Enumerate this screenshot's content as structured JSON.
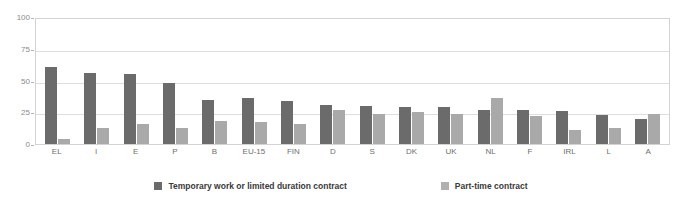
{
  "chart_data": {
    "type": "bar",
    "title": "",
    "xlabel": "",
    "ylabel": "",
    "ylim": [
      0,
      100
    ],
    "yticks": [
      "0",
      "25",
      "50",
      "75",
      "100"
    ],
    "grid": true,
    "legend_position": "bottom",
    "categories": [
      "EL",
      "I",
      "E",
      "P",
      "B",
      "EU-15",
      "FIN",
      "D",
      "S",
      "DK",
      "UK",
      "NL",
      "F",
      "IRL",
      "L",
      "A"
    ],
    "series": [
      {
        "name": "Temporary work or limited duration contract",
        "color": "#6b6b6b",
        "values": [
          61,
          56,
          55,
          48,
          35,
          36,
          34,
          31,
          30,
          29,
          29,
          27,
          27,
          26,
          23,
          20
        ]
      },
      {
        "name": "Part-time contract",
        "color": "#a9a9a9",
        "values": [
          4,
          13,
          16,
          13,
          18,
          17,
          16,
          27,
          24,
          25,
          24,
          36,
          22,
          11,
          13,
          24
        ]
      }
    ]
  },
  "legend": {
    "items": [
      {
        "label": "Temporary work or limited duration contract"
      },
      {
        "label": "Part-time contract"
      }
    ]
  }
}
